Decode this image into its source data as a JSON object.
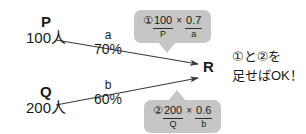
{
  "diagram": {
    "type": "flow-diagram",
    "nodes": [
      {
        "id": "P",
        "letter": "P",
        "count": "100人"
      },
      {
        "id": "Q",
        "letter": "Q",
        "count": "200人"
      },
      {
        "id": "R",
        "letter": "R"
      }
    ],
    "edges": [
      {
        "id": "a",
        "name": "a",
        "percent": "70%",
        "from": "P",
        "to": "R"
      },
      {
        "id": "b",
        "name": "b",
        "percent": "60%",
        "from": "Q",
        "to": "R"
      }
    ],
    "callouts": [
      {
        "id": "callout-1",
        "marker": "①",
        "numerator_left": "100",
        "denominator_left": "P",
        "operator": "×",
        "numerator_right": "0.7",
        "denominator_right": "a",
        "tail": "down"
      },
      {
        "id": "callout-2",
        "marker": "②",
        "numerator_left": "200",
        "denominator_left": "Q",
        "operator": "×",
        "numerator_right": "0.6",
        "denominator_right": "b",
        "tail": "up"
      }
    ],
    "note": {
      "line1": "①と②を",
      "line2": "足せばOK！"
    },
    "colors": {
      "callout_background": "#c6c6c6",
      "text": "#1a1a1a",
      "arrow": "#3a3a3a",
      "page_background": "#ffffff"
    }
  }
}
